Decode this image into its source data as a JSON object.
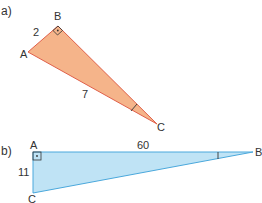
{
  "diagram_a": {
    "part_label": "a)",
    "vertices": {
      "A": "A",
      "B": "B",
      "C": "C"
    },
    "side_AB": "2",
    "side_AC": "7",
    "right_angle_at": "B",
    "marked_angle_at": "C",
    "fill_color": "#f5b48a",
    "stroke_color": "#e0604a"
  },
  "diagram_b": {
    "part_label": "b)",
    "vertices": {
      "A": "A",
      "B": "B",
      "C": "C"
    },
    "side_AB": "60",
    "side_AC": "11",
    "right_angle_at": "A",
    "marked_angle_at": "B",
    "fill_color": "#bfe3f5",
    "stroke_color": "#4aa8dc"
  }
}
